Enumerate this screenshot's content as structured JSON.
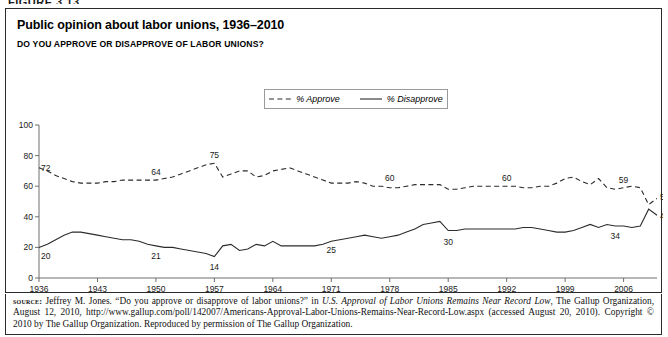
{
  "figure": {
    "label": "FIGURE 3.13"
  },
  "chart": {
    "title": "Public opinion about labor unions, 1936–2010",
    "subtitle": "DO YOU APPROVE OR DISAPPROVE OF LABOR UNIONS?"
  },
  "legend": {
    "position": "top-center",
    "items": [
      {
        "label": "% Approve",
        "style": "dashed",
        "icon": "dashed-line-swatch"
      },
      {
        "label": "% Disapprove",
        "style": "solid",
        "icon": "solid-line-swatch"
      }
    ]
  },
  "source": {
    "prefix": "source:",
    "part1": " Jeffrey M. Jones. “Do you approve or disapprove of labor unions?” in ",
    "italic1": "U.S. Approval of Labor Unions Remains Near Record Low",
    "part2": ", The Gallup Organization, August 12, 2010, http://www.gallup.com/poll/142007/Americans-Approval-Labor-Unions-Remains-Near-Record-Low.aspx (accessed August 20, 2010). Copyright © 2010 by The Gallup Organization. Reproduced by permission of The Gallup Organization."
  },
  "chart_data": {
    "type": "line",
    "title": "Public opinion about labor unions, 1936–2010",
    "subtitle": "DO YOU APPROVE OR DISAPPROVE OF LABOR UNIONS?",
    "xlabel": "",
    "ylabel": "",
    "xlim": [
      1936,
      2010
    ],
    "ylim": [
      0,
      100
    ],
    "yticks": [
      0,
      20,
      40,
      60,
      80,
      100
    ],
    "xticks": [
      1936,
      1943,
      1950,
      1957,
      1964,
      1971,
      1978,
      1985,
      1992,
      1999,
      2006
    ],
    "grid": false,
    "legend_position": "top-center",
    "series": [
      {
        "name": "% Approve",
        "style": "dashed",
        "points": [
          [
            1936,
            72
          ],
          [
            1937,
            70
          ],
          [
            1938,
            67
          ],
          [
            1939,
            65
          ],
          [
            1940,
            63
          ],
          [
            1941,
            62
          ],
          [
            1942,
            62
          ],
          [
            1943,
            62
          ],
          [
            1944,
            63
          ],
          [
            1945,
            63
          ],
          [
            1946,
            64
          ],
          [
            1947,
            64
          ],
          [
            1948,
            64
          ],
          [
            1949,
            64
          ],
          [
            1950,
            64
          ],
          [
            1951,
            65
          ],
          [
            1952,
            66
          ],
          [
            1953,
            68
          ],
          [
            1954,
            70
          ],
          [
            1955,
            72
          ],
          [
            1956,
            74
          ],
          [
            1957,
            75
          ],
          [
            1958,
            66
          ],
          [
            1959,
            68
          ],
          [
            1960,
            70
          ],
          [
            1961,
            70
          ],
          [
            1962,
            66
          ],
          [
            1963,
            67
          ],
          [
            1964,
            70
          ],
          [
            1965,
            71
          ],
          [
            1966,
            72
          ],
          [
            1967,
            70
          ],
          [
            1968,
            68
          ],
          [
            1969,
            66
          ],
          [
            1970,
            64
          ],
          [
            1971,
            62
          ],
          [
            1972,
            62
          ],
          [
            1973,
            62
          ],
          [
            1974,
            63
          ],
          [
            1975,
            62
          ],
          [
            1976,
            60
          ],
          [
            1977,
            60
          ],
          [
            1978,
            59
          ],
          [
            1979,
            59
          ],
          [
            1980,
            60
          ],
          [
            1981,
            61
          ],
          [
            1982,
            61
          ],
          [
            1983,
            61
          ],
          [
            1984,
            61
          ],
          [
            1985,
            58
          ],
          [
            1986,
            58
          ],
          [
            1987,
            59
          ],
          [
            1988,
            60
          ],
          [
            1989,
            60
          ],
          [
            1990,
            60
          ],
          [
            1991,
            60
          ],
          [
            1992,
            60
          ],
          [
            1993,
            60
          ],
          [
            1994,
            59
          ],
          [
            1995,
            59
          ],
          [
            1996,
            60
          ],
          [
            1997,
            60
          ],
          [
            1998,
            62
          ],
          [
            1999,
            65
          ],
          [
            2000,
            66
          ],
          [
            2001,
            63
          ],
          [
            2002,
            61
          ],
          [
            2003,
            65
          ],
          [
            2004,
            59
          ],
          [
            2005,
            58
          ],
          [
            2006,
            59
          ],
          [
            2007,
            60
          ],
          [
            2008,
            59
          ],
          [
            2009,
            48
          ],
          [
            2010,
            52
          ]
        ]
      },
      {
        "name": "% Disapprove",
        "style": "solid",
        "points": [
          [
            1936,
            20
          ],
          [
            1937,
            22
          ],
          [
            1938,
            25
          ],
          [
            1939,
            28
          ],
          [
            1940,
            30
          ],
          [
            1941,
            30
          ],
          [
            1942,
            29
          ],
          [
            1943,
            28
          ],
          [
            1944,
            27
          ],
          [
            1945,
            26
          ],
          [
            1946,
            25
          ],
          [
            1947,
            25
          ],
          [
            1948,
            24
          ],
          [
            1949,
            22
          ],
          [
            1950,
            21
          ],
          [
            1951,
            20
          ],
          [
            1952,
            20
          ],
          [
            1953,
            19
          ],
          [
            1954,
            18
          ],
          [
            1955,
            17
          ],
          [
            1956,
            16
          ],
          [
            1957,
            14
          ],
          [
            1958,
            21
          ],
          [
            1959,
            22
          ],
          [
            1960,
            18
          ],
          [
            1961,
            19
          ],
          [
            1962,
            22
          ],
          [
            1963,
            21
          ],
          [
            1964,
            24
          ],
          [
            1965,
            21
          ],
          [
            1966,
            21
          ],
          [
            1967,
            21
          ],
          [
            1968,
            21
          ],
          [
            1969,
            21
          ],
          [
            1970,
            22
          ],
          [
            1971,
            24
          ],
          [
            1972,
            25
          ],
          [
            1973,
            26
          ],
          [
            1974,
            27
          ],
          [
            1975,
            28
          ],
          [
            1976,
            27
          ],
          [
            1977,
            26
          ],
          [
            1978,
            27
          ],
          [
            1979,
            28
          ],
          [
            1980,
            30
          ],
          [
            1981,
            32
          ],
          [
            1982,
            35
          ],
          [
            1983,
            36
          ],
          [
            1984,
            37
          ],
          [
            1985,
            31
          ],
          [
            1986,
            31
          ],
          [
            1987,
            32
          ],
          [
            1988,
            32
          ],
          [
            1989,
            32
          ],
          [
            1990,
            32
          ],
          [
            1991,
            32
          ],
          [
            1992,
            32
          ],
          [
            1993,
            32
          ],
          [
            1994,
            33
          ],
          [
            1995,
            33
          ],
          [
            1996,
            32
          ],
          [
            1997,
            31
          ],
          [
            1998,
            30
          ],
          [
            1999,
            30
          ],
          [
            2000,
            31
          ],
          [
            2001,
            33
          ],
          [
            2002,
            35
          ],
          [
            2003,
            33
          ],
          [
            2004,
            35
          ],
          [
            2005,
            34
          ],
          [
            2006,
            34
          ],
          [
            2007,
            33
          ],
          [
            2008,
            34
          ],
          [
            2009,
            45
          ],
          [
            2010,
            41
          ]
        ]
      }
    ],
    "annotations": [
      {
        "series": "% Approve",
        "x": 1936,
        "value": 72,
        "text": "72"
      },
      {
        "series": "% Approve",
        "x": 1950,
        "value": 64,
        "text": "64"
      },
      {
        "series": "% Approve",
        "x": 1957,
        "value": 75,
        "text": "75"
      },
      {
        "series": "% Approve",
        "x": 1978,
        "value": 60,
        "text": "60"
      },
      {
        "series": "% Approve",
        "x": 1992,
        "value": 60,
        "text": "60"
      },
      {
        "series": "% Approve",
        "x": 2006,
        "value": 59,
        "text": "59"
      },
      {
        "series": "% Approve",
        "x": 2010,
        "value": 52,
        "text": "52"
      },
      {
        "series": "% Disapprove",
        "x": 1936,
        "value": 20,
        "text": "20"
      },
      {
        "series": "% Disapprove",
        "x": 1950,
        "value": 21,
        "text": "21"
      },
      {
        "series": "% Disapprove",
        "x": 1957,
        "value": 14,
        "text": "14"
      },
      {
        "series": "% Disapprove",
        "x": 1971,
        "value": 25,
        "text": "25"
      },
      {
        "series": "% Disapprove",
        "x": 1985,
        "value": 30,
        "text": "30"
      },
      {
        "series": "% Disapprove",
        "x": 2005,
        "value": 34,
        "text": "34"
      },
      {
        "series": "% Disapprove",
        "x": 2010,
        "value": 41,
        "text": "41"
      }
    ]
  }
}
